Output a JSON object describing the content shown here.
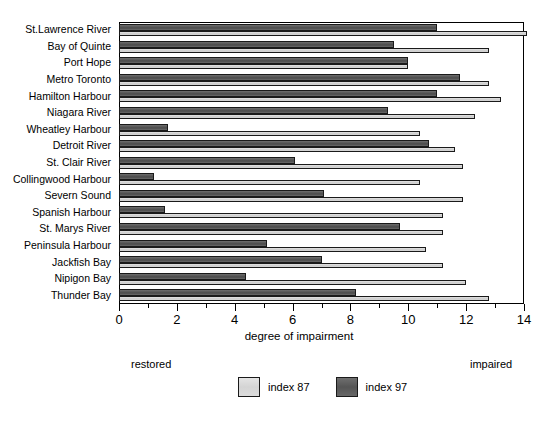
{
  "chart_data": {
    "type": "bar",
    "orientation": "horizontal",
    "title": "",
    "xlabel": "degree of impairment",
    "ylabel": "",
    "xlim": [
      0,
      14
    ],
    "xticks": [
      0,
      2,
      4,
      6,
      8,
      10,
      12,
      14
    ],
    "xtick_labels": [
      "0",
      "2",
      "4",
      "6",
      "8",
      "10",
      "12",
      "14"
    ],
    "minor_tick_step": 1,
    "grid": false,
    "legend_position": "bottom-center",
    "categories": [
      "St.Lawrence River",
      "Bay of Quinte",
      "Port Hope",
      "Metro Toronto",
      "Hamilton Harbour",
      "Niagara River",
      "Wheatley Harbour",
      "Detroit River",
      "St. Clair River",
      "Collingwood Harbour",
      "Severn Sound",
      "Spanish Harbour",
      "St. Marys River",
      "Peninsula Harbour",
      "Jackfish Bay",
      "Nipigon Bay",
      "Thunder Bay"
    ],
    "series": [
      {
        "name": "index 97",
        "color": "#595959",
        "values": [
          11.0,
          9.5,
          10.0,
          11.8,
          11.0,
          9.3,
          1.7,
          10.7,
          6.1,
          1.2,
          7.1,
          1.6,
          9.7,
          5.1,
          7.0,
          4.4,
          8.2
        ]
      },
      {
        "name": "index 87",
        "color": "#d5d5d5",
        "values": [
          14.1,
          12.8,
          10.0,
          12.8,
          13.2,
          12.3,
          10.4,
          11.6,
          11.9,
          10.4,
          11.9,
          11.2,
          11.2,
          10.6,
          11.2,
          12.0,
          12.8
        ]
      }
    ],
    "annotations": {
      "left_end": "restored",
      "right_end": "impaired"
    }
  },
  "legend": {
    "items": [
      {
        "label": "index 87",
        "swatch": "light-gray-swatch"
      },
      {
        "label": "index 97",
        "swatch": "dark-gray-swatch"
      }
    ]
  }
}
